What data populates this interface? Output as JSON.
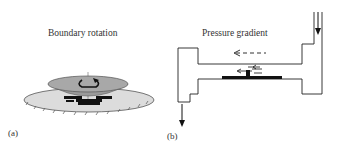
{
  "panel_a": {
    "title": "Boundary rotation",
    "label": "(a)",
    "colors": {
      "top_disk": "#9a9a9a",
      "bottom_disk": "#dcdcdc",
      "particles": "#111111"
    }
  },
  "panel_b": {
    "title": "Pressure gradient",
    "label": "(b)",
    "colors": {
      "channel": "#222222",
      "particles": "#111111"
    }
  }
}
